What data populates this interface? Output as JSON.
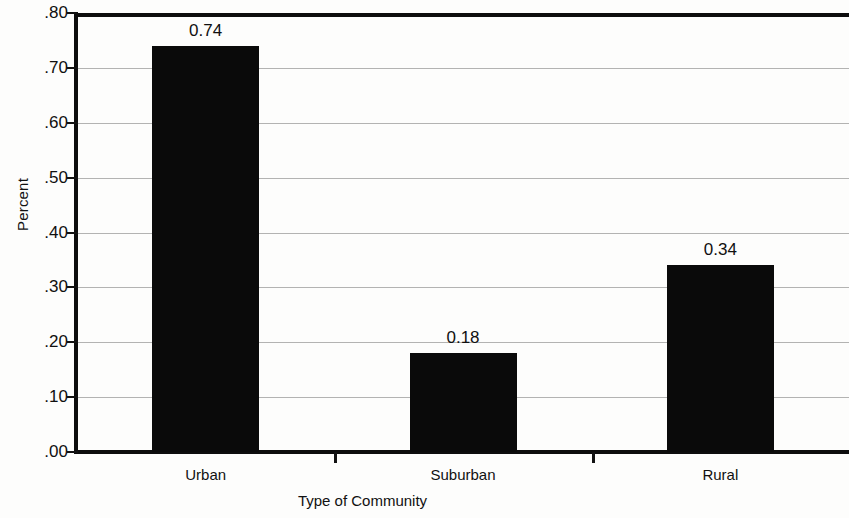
{
  "chart_data": {
    "type": "bar",
    "title": "",
    "xlabel": "Type of Community",
    "ylabel": "Percent",
    "categories": [
      "Urban",
      "Suburban",
      "Rural"
    ],
    "values": [
      0.74,
      0.18,
      0.34
    ],
    "value_labels": [
      "0.74",
      "0.18",
      "0.34"
    ],
    "ylim": [
      0.0,
      0.8
    ],
    "ytick_values": [
      0.8,
      0.7,
      0.6,
      0.5,
      0.4,
      0.3,
      0.2,
      0.1,
      0.0
    ],
    "ytick_labels": [
      ".80",
      ".70",
      ".60",
      ".50",
      ".40",
      ".30",
      ".20",
      ".10",
      ".00"
    ],
    "grid": true,
    "legend": null,
    "bar_color": "#0a0a0a",
    "gridline_color": "#9a9a9a",
    "axis_color": "#0d0d0d",
    "background_color": "#fdfdfc"
  },
  "axes": {
    "y_title": "Percent",
    "x_title": "Type of Community"
  },
  "ticks": {
    "y": [
      {
        "label": ".80",
        "value": 0.8
      },
      {
        "label": ".70",
        "value": 0.7
      },
      {
        "label": ".60",
        "value": 0.6
      },
      {
        "label": ".50",
        "value": 0.5
      },
      {
        "label": ".40",
        "value": 0.4
      },
      {
        "label": ".30",
        "value": 0.3
      },
      {
        "label": ".20",
        "value": 0.2
      },
      {
        "label": ".10",
        "value": 0.1
      },
      {
        "label": ".00",
        "value": 0.0
      }
    ]
  },
  "bars": [
    {
      "category": "Urban",
      "value": 0.74,
      "label": "0.74"
    },
    {
      "category": "Suburban",
      "value": 0.18,
      "label": "0.18"
    },
    {
      "category": "Rural",
      "value": 0.34,
      "label": "0.34"
    }
  ]
}
